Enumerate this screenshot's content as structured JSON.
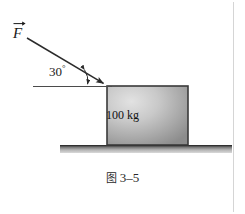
{
  "figure": {
    "caption_prefix": "图",
    "caption_number": "3–5",
    "caption_full": "图 3–5"
  },
  "diagram": {
    "force_vector": {
      "symbol": "F",
      "name": "applied-force-vector",
      "has_arrow_overbar": true,
      "direction": "down-right",
      "tail_x": 27,
      "tail_y": 38,
      "tip_x": 107,
      "tip_y": 86
    },
    "angle": {
      "value": "30",
      "degree_symbol": "°",
      "label": "30°",
      "measured_from": "horizontal-reference-line"
    },
    "block": {
      "mass_label": "100 kg",
      "mass_value": "100",
      "mass_unit": "kg",
      "x": 107,
      "y": 86,
      "width": 81,
      "height": 59
    },
    "ground": {
      "label": "",
      "x": 60,
      "y": 145,
      "width": 172,
      "height": 8
    },
    "reference_line": {
      "label": "horizontal",
      "x1": 33,
      "x2": 112,
      "y": 86
    }
  },
  "colors": {
    "background": "#ffffff",
    "stroke": "#2b2b2b",
    "block_border": "#3a3a3a",
    "block_fill_light": "#d8d8d8",
    "block_fill_dark": "#8a8a8a",
    "ground_dark": "#4a4a4a",
    "ground_light": "#cfcfcf",
    "text": "#1a1a1a",
    "rule": "#d5d5d5"
  }
}
